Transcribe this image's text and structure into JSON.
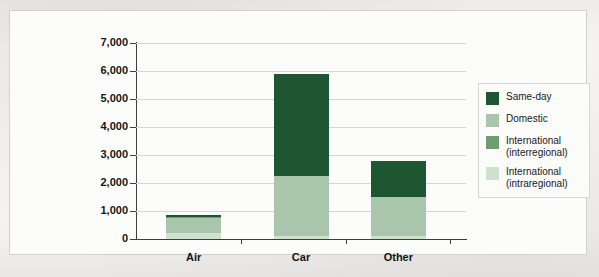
{
  "chart_data": {
    "type": "bar",
    "subtype": "stacked-bar",
    "title": "",
    "xlabel": "",
    "ylabel": "Trips (million)",
    "ylim": [
      0,
      7000
    ],
    "ytick_labels": [
      "7,000",
      "6,000",
      "5,000",
      "4,000",
      "3,000",
      "2,000",
      "1,000",
      "0"
    ],
    "ytick_values": [
      7000,
      6000,
      5000,
      4000,
      3000,
      2000,
      1000,
      0
    ],
    "grid": true,
    "legend_position": "right",
    "categories": [
      "Air",
      "Car",
      "Other"
    ],
    "series": [
      {
        "name": "Same-day",
        "color": "#1e5631",
        "values": [
          60,
          3650,
          1300
        ]
      },
      {
        "name": "Domestic",
        "color": "#a9c5ab",
        "values": [
          540,
          2150,
          1400
        ]
      },
      {
        "name": "International (interregional)",
        "color": "#6d9d70",
        "values": [
          50,
          0,
          0
        ]
      },
      {
        "name": "International (intraregional)",
        "color": "#cfe2d0",
        "values": [
          200,
          100,
          100
        ]
      }
    ],
    "totals": [
      850,
      5900,
      2800
    ],
    "legend_entries": [
      "Same-day",
      "Domestic",
      "International\n(interregional)",
      "International\n(intraregional)"
    ]
  },
  "colors": {
    "same_day": "#1e5631",
    "domestic": "#a9c5ab",
    "international_interregional": "#6d9d70",
    "international_intraregional": "#cfe2d0",
    "axis": "#3d3d3d",
    "gridline": "#d3d8d3",
    "panel_background": "#fcfcfb",
    "page_background": "#f3f2f0"
  }
}
